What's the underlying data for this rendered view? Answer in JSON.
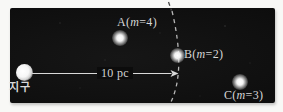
{
  "colors": {
    "sky_background": "#0c0c0c",
    "frame_background": "#f8f8f6",
    "label_text": "#d6d6d6",
    "arc_dash_light": "#c9c9c9",
    "arc_dash_dark": "#4a4a4a",
    "arrow": "#d9d9d9",
    "star": "#ffffff"
  },
  "earth": {
    "label": "지구"
  },
  "distance": {
    "label": "10 pc",
    "value": 10,
    "unit": "pc"
  },
  "stars": [
    {
      "name": "A",
      "label": "A(m=4)",
      "label_prefix": "A(",
      "label_var": "m",
      "label_suffix": "=4)",
      "apparent_magnitude": 4
    },
    {
      "name": "B",
      "label": "B(m=2)",
      "label_prefix": "B(",
      "label_var": "m",
      "label_suffix": "=2)",
      "apparent_magnitude": 2,
      "position_note": "on 10 pc arc"
    },
    {
      "name": "C",
      "label": "C(m=3)",
      "label_prefix": "C(",
      "label_var": "m",
      "label_suffix": "=3)",
      "apparent_magnitude": 3
    }
  ]
}
